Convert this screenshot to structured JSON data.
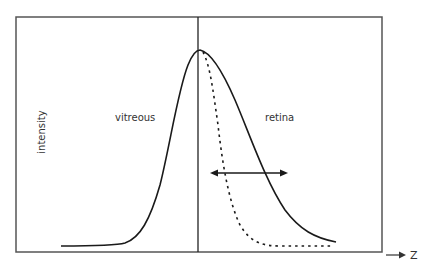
{
  "diagram": {
    "type": "line",
    "title": "",
    "ylabel": "intensity",
    "xlabel": "Z",
    "regions": [
      {
        "label": "vitreous"
      },
      {
        "label": "retina"
      }
    ],
    "curves": [
      {
        "name": "solid-profile",
        "style": "solid",
        "description": "broad intensity profile rising in vitreous, peaking at boundary, slowly decaying into retina"
      },
      {
        "name": "dotted-profile",
        "style": "dotted",
        "description": "narrower profile sharing the rising edge, decaying rapidly in retina"
      }
    ],
    "annotations": [
      {
        "type": "double-arrow",
        "description": "horizontal width indicator between the two decaying curves in retina"
      },
      {
        "type": "boundary-line",
        "description": "vertical line at the vitreous/retina interface"
      }
    ],
    "colors": {
      "line": "#1a1a1a",
      "frame": "#555555",
      "text": "#333333",
      "background": "#ffffff"
    }
  }
}
